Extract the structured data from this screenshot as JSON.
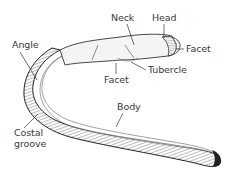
{
  "diagram": {
    "labels": {
      "angle": "Angle",
      "neck": "Neck",
      "head": "Head",
      "facet_head": "Facet",
      "tubercle": "Tubercle",
      "facet_tubercle": "Facet",
      "body": "Body",
      "costal_groove_line1": "Costal",
      "costal_groove_line2": "groove"
    }
  }
}
